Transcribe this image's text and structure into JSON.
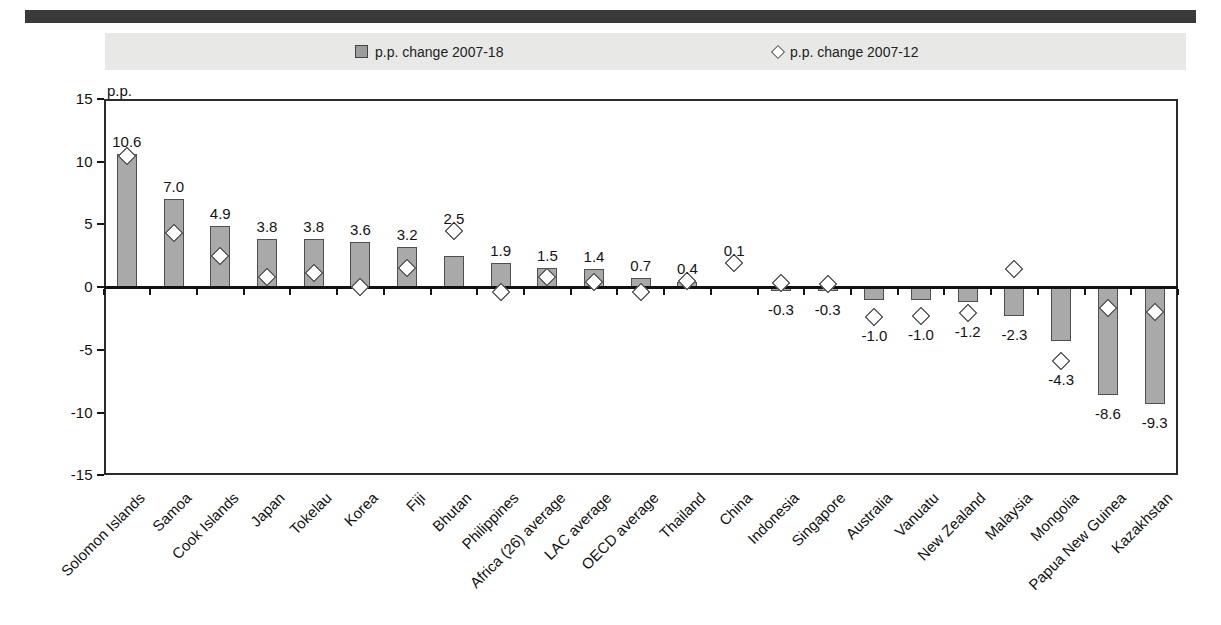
{
  "top_bar": {
    "color": "#3a3a3a"
  },
  "legend": {
    "background": "#e8e8e6",
    "items": [
      {
        "label": "p.p. change 2007-18",
        "marker": "square-icon",
        "marker_color": "#9c9c9c"
      },
      {
        "label": "p.p. change 2007-12",
        "marker": "diamond-icon",
        "marker_color": "#ffffff"
      }
    ]
  },
  "chart_data": {
    "type": "bar",
    "title": "",
    "xlabel": "",
    "ylabel": "p.p.",
    "ylim": [
      -15,
      15
    ],
    "grid": false,
    "legend_position": "top",
    "yticks": [
      15,
      10,
      5,
      0,
      -5,
      -10,
      -15
    ],
    "ytick_labels": [
      "15",
      "10",
      "5",
      "0",
      "-5",
      "-10",
      "-15"
    ],
    "categories": [
      "Solomon Islands",
      "Samoa",
      "Cook Islands",
      "Japan",
      "Tokelau",
      "Korea",
      "Fiji",
      "Bhutan",
      "Philippines",
      "Africa (26) average",
      "LAC average",
      "OECD average",
      "Thailand",
      "China",
      "Indonesia",
      "Singapore",
      "Australia",
      "Vanuatu",
      "New Zealand",
      "Malaysia",
      "Mongolia",
      "Papua New Guinea",
      "Kazakhstan"
    ],
    "series": [
      {
        "name": "p.p. change 2007-18",
        "type": "bar",
        "values": [
          10.6,
          7.0,
          4.9,
          3.8,
          3.8,
          3.6,
          3.2,
          2.5,
          1.9,
          1.5,
          1.4,
          0.7,
          0.4,
          0.1,
          -0.3,
          -0.3,
          -1.0,
          -1.0,
          -1.2,
          -2.3,
          -4.3,
          -8.6,
          -9.3
        ]
      },
      {
        "name": "p.p. change 2007-12",
        "type": "scatter",
        "values": [
          10.4,
          4.3,
          2.5,
          0.8,
          1.1,
          0.0,
          1.5,
          4.5,
          -0.4,
          0.8,
          0.4,
          -0.4,
          0.5,
          1.9,
          0.3,
          0.2,
          -2.4,
          -2.3,
          -2.1,
          1.4,
          -5.9,
          -1.7,
          -2.0
        ]
      }
    ],
    "labels": [
      "10.6",
      "7.0",
      "4.9",
      "3.8",
      "3.8",
      "3.6",
      "3.2",
      "2.5",
      "1.9",
      "1.5",
      "1.4",
      "0.7",
      "0.4",
      "0.1",
      "-0.3",
      "-0.3",
      "-1.0",
      "-1.0",
      "-1.2",
      "-2.3",
      "-4.3",
      "-8.6",
      "-9.3"
    ],
    "colors": {
      "bar_fill": "#a9a9a9",
      "bar_border": "#4f4f4f",
      "marker_fill": "#ffffff",
      "marker_border": "#2a2a2a",
      "axis": "#2b2b2b",
      "text": "#111111"
    }
  }
}
